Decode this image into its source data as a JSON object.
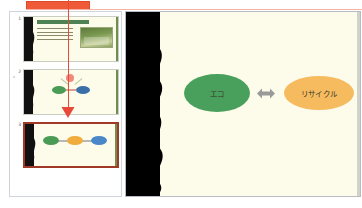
{
  "app": {
    "type": "presentation-editor",
    "background_color": "#ffffff"
  },
  "annotation": {
    "highlight_rect": {
      "name": "orange-highlight-rectangle",
      "color": "#ef5a38"
    },
    "pointer_arrow": {
      "name": "red-down-arrow",
      "color": "#e8493a",
      "points_to": "slide-3"
    },
    "guide_line_color": "#f3b2a2"
  },
  "slide_panel": {
    "name": "slide-thumbnail-panel",
    "slides": [
      {
        "number": "1",
        "title": "企業だできる活動",
        "selected": false,
        "has_photo": true,
        "body_lines": 4
      },
      {
        "number": "2",
        "number_sub": "*",
        "selected": false,
        "nodes": [
          {
            "label": "",
            "color": "#4a9b55"
          },
          {
            "label": "",
            "color": "#3a6fa8"
          }
        ]
      },
      {
        "number": "3",
        "selected": true,
        "nodes": [
          {
            "label": "",
            "color": "#4a9b55"
          },
          {
            "label": "",
            "color": "#f0ac3c"
          },
          {
            "label": "",
            "color": "#4a87c8"
          }
        ]
      }
    ]
  },
  "main_slide": {
    "name": "main-slide-canvas",
    "background_color": "#fdfbe9",
    "band_color": "#000000",
    "shapes": [
      {
        "type": "oval",
        "label": "エコ",
        "fill": "#49a05c",
        "text_color": "#3a3a2a"
      },
      {
        "type": "oval",
        "label": "リサイクル",
        "fill": "#f6bb5e",
        "text_color": "#3a3a2a"
      }
    ],
    "connectors": [
      {
        "type": "double-arrow",
        "color": "#9a9a9a"
      },
      {
        "type": "double-arrow",
        "color": "#9a9a9a"
      }
    ]
  }
}
